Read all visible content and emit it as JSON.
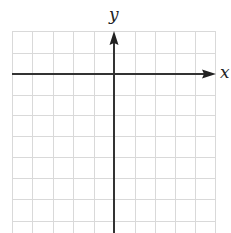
{
  "diagram": {
    "type": "coordinate-plane",
    "x_axis_label": "x",
    "y_axis_label": "y",
    "grid": {
      "columns": 10,
      "rows_visible": 10,
      "left": 12,
      "right": 215,
      "top": 31,
      "spacing": 20.3,
      "line_color": "#d9d9d9"
    },
    "axes": {
      "origin_px": [
        114,
        74
      ],
      "color": "#333333",
      "x_arrow": "right",
      "y_arrow": "up"
    }
  }
}
